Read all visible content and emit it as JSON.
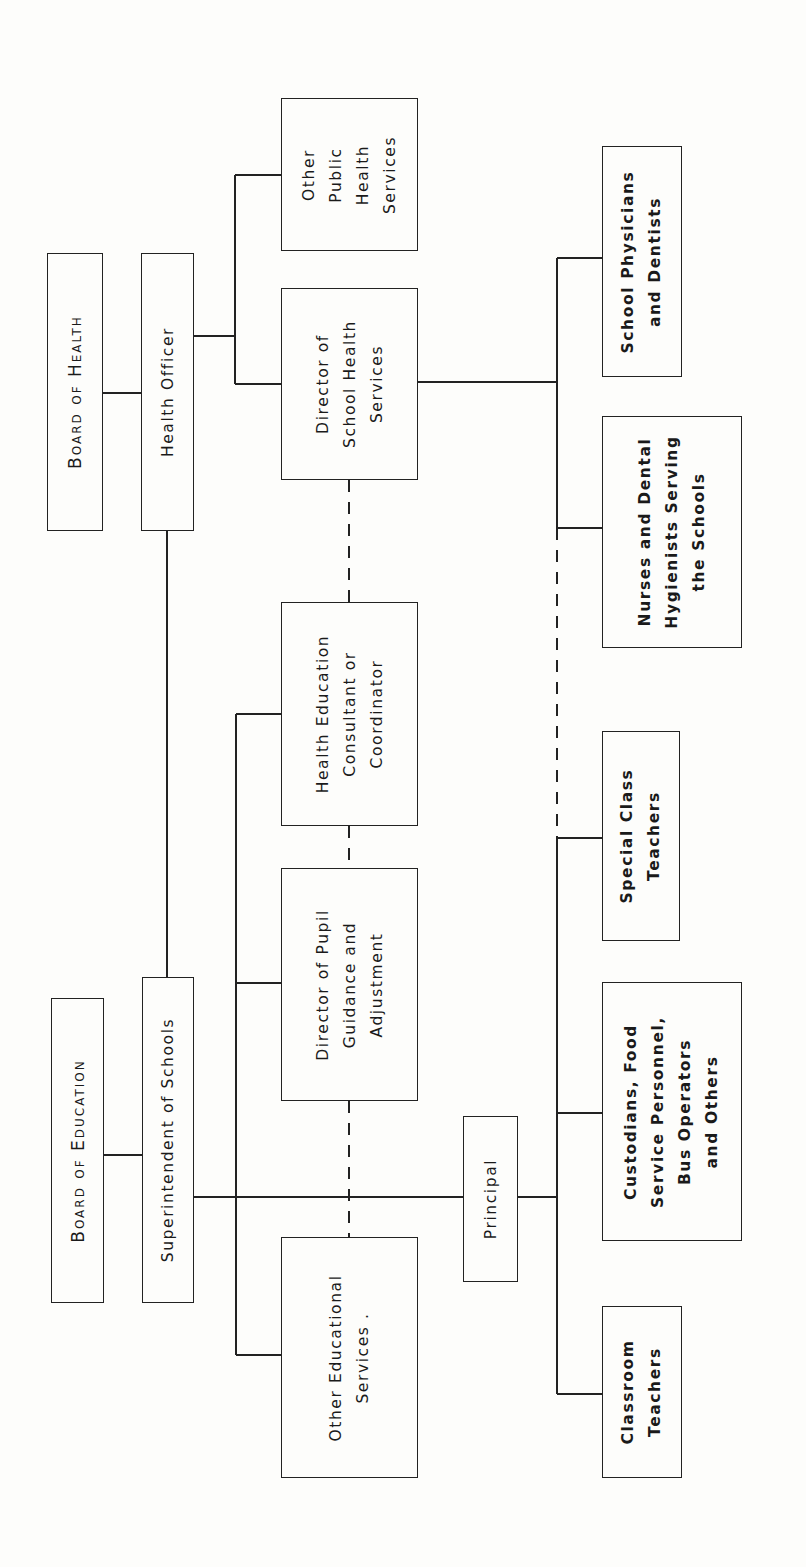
{
  "diagram": {
    "type": "organization-chart",
    "orientation": "rotated-90-ccw",
    "nodes": {
      "board_of_health": "Board of Health",
      "health_officer": "Health Officer",
      "other_public_health": "Other\nPublic\nHealth\nServices",
      "director_school_health": "Director of\nSchool Health\nServices",
      "health_education": "Health Education\nConsultant or\nCoordinator",
      "director_pupil": "Director of Pupil\nGuidance and\nAdjustment",
      "other_educational": "Other Educational\nServices .",
      "board_of_education": "Board of Education",
      "superintendent": "Superintendent of Schools",
      "principal": "Principal",
      "school_physicians": "School Physicians\nand Dentists",
      "nurses": "Nurses and Dental\nHygienists Serving\nthe Schools",
      "special_class": "Special Class\nTeachers",
      "custodians": "Custodians, Food\nService Personnel,\nBus Operators\nand Others",
      "classroom": "Classroom\nTeachers"
    },
    "edges": [
      {
        "from": "Board of Health",
        "to": "Health Officer",
        "style": "solid"
      },
      {
        "from": "Health Officer",
        "to": "Other Public Health Services",
        "style": "solid"
      },
      {
        "from": "Health Officer",
        "to": "Director of School Health Services",
        "style": "solid"
      },
      {
        "from": "Health Officer",
        "to": "Superintendent of Schools",
        "style": "solid"
      },
      {
        "from": "Board of Education",
        "to": "Superintendent of Schools",
        "style": "solid"
      },
      {
        "from": "Superintendent of Schools",
        "to": "Health Education Consultant or Coordinator",
        "style": "solid"
      },
      {
        "from": "Superintendent of Schools",
        "to": "Director of Pupil Guidance and Adjustment",
        "style": "solid"
      },
      {
        "from": "Superintendent of Schools",
        "to": "Other Educational Services",
        "style": "solid"
      },
      {
        "from": "Superintendent of Schools",
        "to": "Principal",
        "style": "solid"
      },
      {
        "from": "Director of School Health Services",
        "to": "Health Education Consultant or Coordinator",
        "style": "dashed"
      },
      {
        "from": "Health Education Consultant or Coordinator",
        "to": "Director of Pupil Guidance and Adjustment",
        "style": "dashed"
      },
      {
        "from": "Director of Pupil Guidance and Adjustment",
        "to": "Other Educational Services",
        "style": "dashed"
      },
      {
        "from": "Director of School Health Services",
        "to": "School Physicians and Dentists",
        "style": "solid"
      },
      {
        "from": "Director of School Health Services",
        "to": "Nurses and Dental Hygienists Serving the Schools",
        "style": "solid"
      },
      {
        "from": "Director of School Health Services",
        "to": "Special Class Teachers",
        "style": "dashed"
      },
      {
        "from": "Principal",
        "to": "Special Class Teachers",
        "style": "solid"
      },
      {
        "from": "Principal",
        "to": "Custodians, Food Service Personnel, Bus Operators and Others",
        "style": "solid"
      },
      {
        "from": "Principal",
        "to": "Classroom Teachers",
        "style": "solid"
      }
    ]
  }
}
